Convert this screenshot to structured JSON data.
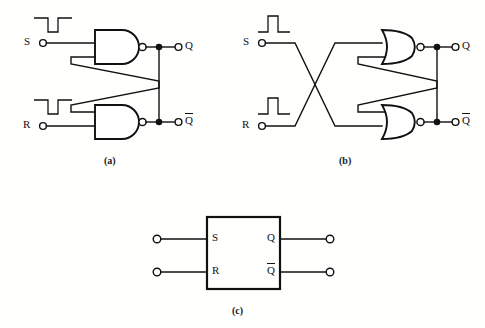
{
  "figure": {
    "type": "logic-circuit-diagram",
    "background_color": "#ffffff",
    "line_color": "#111111",
    "panels": [
      {
        "id": "a",
        "caption": "(a)",
        "gate_type": "NAND",
        "description": "Cross-coupled NAND gate SR latch",
        "inputs": [
          {
            "label": "S",
            "pulse": "negative-going",
            "terminal": "open-circle"
          },
          {
            "label": "R",
            "pulse": "negative-going",
            "terminal": "open-circle"
          }
        ],
        "outputs": [
          {
            "label": "Q",
            "terminal": "open-circle",
            "junction": "filled-dot"
          },
          {
            "label": "Q",
            "overbar": true,
            "terminal": "open-circle",
            "junction": "filled-dot"
          }
        ],
        "gates": [
          {
            "name": "upper-nand",
            "type": "NAND",
            "inputs": 2,
            "bubble": true
          },
          {
            "name": "lower-nand",
            "type": "NAND",
            "inputs": 2,
            "bubble": true
          }
        ],
        "feedback": "cross-coupled"
      },
      {
        "id": "b",
        "caption": "(b)",
        "gate_type": "NOR",
        "description": "Cross-coupled NOR gate SR latch with crossed inputs",
        "inputs": [
          {
            "label": "S",
            "pulse": "positive-going",
            "terminal": "open-circle"
          },
          {
            "label": "R",
            "pulse": "positive-going",
            "terminal": "open-circle"
          }
        ],
        "outputs": [
          {
            "label": "Q",
            "terminal": "open-circle",
            "junction": "filled-dot"
          },
          {
            "label": "Q",
            "overbar": true,
            "terminal": "open-circle",
            "junction": "filled-dot"
          }
        ],
        "gates": [
          {
            "name": "upper-nor",
            "type": "NOR",
            "inputs": 2,
            "bubble": true
          },
          {
            "name": "lower-nor",
            "type": "NOR",
            "inputs": 2,
            "bubble": true
          }
        ],
        "feedback": "cross-coupled",
        "input_crossing": true
      },
      {
        "id": "c",
        "caption": "(c)",
        "description": "Block symbol for SR flip-flop",
        "shape": "rectangle",
        "input_pins": [
          {
            "label": "S",
            "terminal": "open-circle"
          },
          {
            "label": "R",
            "terminal": "open-circle"
          }
        ],
        "output_pins": [
          {
            "label": "Q",
            "terminal": "open-circle"
          },
          {
            "label": "Q",
            "overbar": true,
            "terminal": "open-circle"
          }
        ]
      }
    ],
    "labels": {
      "s": "S",
      "r": "R",
      "q": "Q",
      "qbar": "Q",
      "cap_a": "(a)",
      "cap_b": "(b)",
      "cap_c": "(c)"
    }
  }
}
